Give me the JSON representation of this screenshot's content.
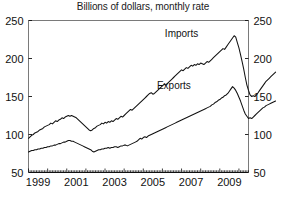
{
  "chart_data": {
    "type": "line",
    "title": "Billions of dollars, monthly rate",
    "xlabel": "",
    "ylabel": "",
    "ylim": [
      50,
      250
    ],
    "xlim": [
      1999.0,
      2010.5
    ],
    "yticks": [
      50,
      100,
      150,
      200,
      250
    ],
    "ytick_labels": [
      "50",
      "100",
      "150",
      "200",
      "250"
    ],
    "ytick_labels_right": [
      "50",
      "100",
      "150",
      "200",
      "250"
    ],
    "xticks": [
      1999,
      2001,
      2003,
      2005,
      2007,
      2009
    ],
    "xtick_labels": [
      "1999",
      "2001",
      "2003",
      "2005",
      "2007",
      "2009"
    ],
    "minor_tick_interval_months": 1,
    "grid": false,
    "legend_position": "inline-annotation",
    "dual_y_axis": true,
    "line_color": "#111111",
    "series": [
      {
        "name": "Imports",
        "annotation_label": "Imports",
        "annotation_x": 2007.0,
        "annotation_y": 228,
        "values": [
          95,
          97,
          99,
          100,
          102,
          103,
          104,
          106,
          107,
          108,
          110,
          111,
          112,
          113,
          115,
          114,
          116,
          118,
          117,
          119,
          120,
          122,
          121,
          123,
          124,
          125,
          124,
          125,
          124,
          123,
          122,
          120,
          118,
          116,
          114,
          112,
          110,
          108,
          106,
          105,
          106,
          108,
          109,
          111,
          112,
          113,
          115,
          114,
          116,
          115,
          117,
          116,
          118,
          117,
          119,
          121,
          120,
          122,
          124,
          123,
          125,
          127,
          129,
          131,
          133,
          132,
          134,
          136,
          138,
          140,
          142,
          144,
          146,
          148,
          150,
          152,
          154,
          155,
          153,
          154,
          156,
          158,
          160,
          162,
          164,
          166,
          165,
          167,
          169,
          171,
          173,
          175,
          177,
          179,
          181,
          183,
          185,
          184,
          186,
          188,
          187,
          189,
          191,
          190,
          192,
          191,
          193,
          192,
          194,
          193,
          192,
          194,
          196,
          195,
          197,
          199,
          201,
          203,
          205,
          207,
          209,
          211,
          213,
          212,
          215,
          218,
          221,
          224,
          227,
          230,
          228,
          221,
          214,
          205,
          196,
          186,
          175,
          165,
          158,
          152,
          150,
          151,
          150,
          152,
          155,
          158,
          161,
          164,
          167,
          170,
          172,
          174,
          176,
          178,
          180,
          182
        ],
        "peak_value": 230,
        "trough_value": 150,
        "start_value": 95,
        "end_value": 182
      },
      {
        "name": "Exports",
        "annotation_label": "Exports",
        "annotation_x": 2006.6,
        "annotation_y": 160,
        "values": [
          77,
          78,
          79,
          79,
          80,
          80,
          81,
          81,
          82,
          82,
          83,
          83,
          84,
          84,
          85,
          85,
          86,
          86,
          87,
          88,
          88,
          89,
          90,
          90,
          91,
          92,
          92,
          91,
          91,
          90,
          89,
          88,
          87,
          86,
          85,
          84,
          83,
          82,
          81,
          80,
          78,
          77,
          78,
          79,
          80,
          80,
          81,
          81,
          82,
          82,
          83,
          82,
          83,
          83,
          84,
          84,
          83,
          84,
          85,
          85,
          86,
          86,
          85,
          86,
          87,
          88,
          89,
          90,
          91,
          93,
          95,
          94,
          96,
          97,
          96,
          98,
          99,
          100,
          101,
          102,
          103,
          104,
          105,
          106,
          107,
          108,
          109,
          110,
          111,
          112,
          113,
          114,
          115,
          116,
          117,
          118,
          119,
          120,
          121,
          122,
          123,
          124,
          125,
          126,
          127,
          128,
          129,
          130,
          131,
          132,
          133,
          134,
          135,
          136,
          137,
          139,
          140,
          142,
          143,
          145,
          146,
          148,
          149,
          151,
          152,
          154,
          157,
          160,
          163,
          161,
          158,
          154,
          149,
          144,
          138,
          132,
          127,
          124,
          121,
          122,
          121,
          123,
          125,
          127,
          129,
          131,
          133,
          135,
          136,
          138,
          139,
          140,
          141,
          142,
          143,
          144
        ],
        "peak_value": 163,
        "trough_value": 121,
        "start_value": 77,
        "end_value": 144
      }
    ]
  }
}
